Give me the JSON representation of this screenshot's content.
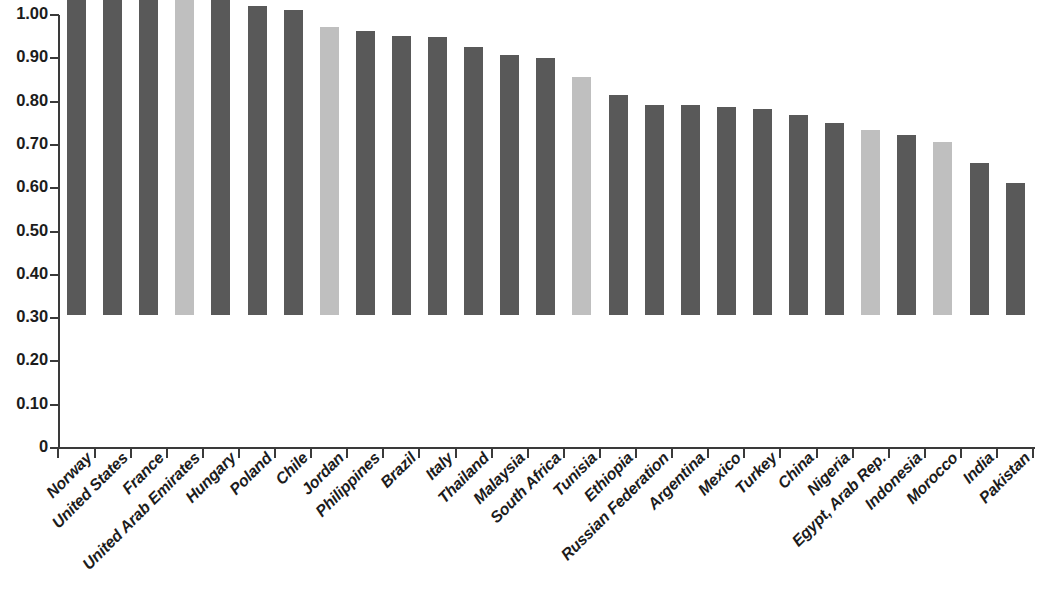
{
  "chart": {
    "type": "bar",
    "title": "",
    "subtitle": "",
    "xlabel": "",
    "ylabel": "",
    "legend": [],
    "grid": false,
    "background_color": "#ffffff",
    "axis_color": "#3a3a3a",
    "colors": {
      "primary_bar": "#595959",
      "highlight_bar": "#bfbfbf"
    }
  },
  "chart_data": {
    "type": "bar",
    "title": "",
    "xlabel": "",
    "ylabel": "",
    "ylim": [
      0,
      1.0
    ],
    "grid": false,
    "legend_position": "none",
    "y_ticks": [
      "0",
      "0.10",
      "0.20",
      "0.30",
      "0.40",
      "0.50",
      "0.60",
      "0.70",
      "0.80",
      "0.90",
      "1.00"
    ],
    "y_tick_values": [
      0,
      0.1,
      0.2,
      0.3,
      0.4,
      0.5,
      0.6,
      0.7,
      0.8,
      0.9,
      1.0
    ],
    "categories": [
      "Norway",
      "United States",
      "France",
      "United Arab Emirates",
      "Hungary",
      "Poland",
      "Chile",
      "Jordan",
      "Philippines",
      "Brazil",
      "Italy",
      "Thailand",
      "Malaysia",
      "South Africa",
      "Tunisia",
      "Ethiopia",
      "Russian Federation",
      "Argentina",
      "Mexico",
      "Turkey",
      "China",
      "Nigeria",
      "Egypt, Arab Rep.",
      "Indonesia",
      "Morocco",
      "India",
      "Pakistan"
    ],
    "values": [
      0.92,
      0.845,
      0.829,
      0.76,
      0.731,
      0.713,
      0.705,
      0.665,
      0.657,
      0.644,
      0.643,
      0.619,
      0.601,
      0.593,
      0.549,
      0.508,
      0.485,
      0.484,
      0.481,
      0.475,
      0.462,
      0.443,
      0.428,
      0.416,
      0.399,
      0.351,
      0.306
    ],
    "bar_colors": [
      "#595959",
      "#595959",
      "#595959",
      "#bfbfbf",
      "#595959",
      "#595959",
      "#595959",
      "#bfbfbf",
      "#595959",
      "#595959",
      "#595959",
      "#595959",
      "#595959",
      "#595959",
      "#bfbfbf",
      "#595959",
      "#595959",
      "#595959",
      "#595959",
      "#595959",
      "#595959",
      "#595959",
      "#bfbfbf",
      "#595959",
      "#bfbfbf",
      "#595959",
      "#595959"
    ]
  }
}
